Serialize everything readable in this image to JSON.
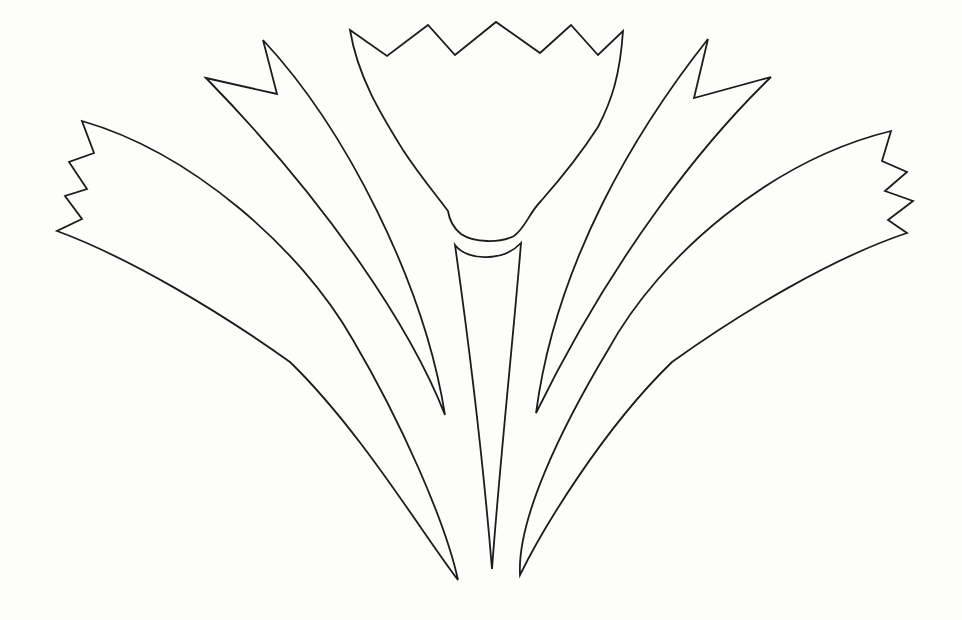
{
  "page": {
    "background": "#fdfdfc"
  },
  "drawing": {
    "canvas": {
      "width": 962,
      "height": 620,
      "stroke_color": "#1c1c1c",
      "stroke_width": 1.8,
      "fill": "none"
    },
    "shapes": [
      {
        "name": "outer-left-petal",
        "description": "curved petal blade with serrated zigzag outer end, sweeping from upper left down to bottom center",
        "path": "M 82 121 C 190 152 300 247 353 340 C 400 420 445 520 458 580 C 420 530 360 430 290 362 C 220 312 130 258 57 231 L 82 219 L 65 196 L 87 189 L 69 162 L 94 153 Z"
      },
      {
        "name": "inner-left-petal",
        "description": "slender curved blade with swallowtail notch at its upper tip, sweeping down to bottom center",
        "path": "M 206 78 L 277 94 L 263 40 C 345 128 424 282 445 415 C 412 330 330 205 206 78 Z"
      },
      {
        "name": "flower-corolla",
        "description": "central tulip-shaped bloom with five-point zigzag crown and rounded cup bottom",
        "path": "M 350 30 L 387 56 L 428 25 L 455 55 L 496 22 L 540 53 L 571 25 L 598 55 L 623 31 C 620 75 612 100 598 127 C 578 158 556 184 541 201 C 529 213 526 227 514 236 C 500 243 474 243 461 234 C 451 226 449 218 448 211 C 437 196 420 176 403 150 C 382 116 358 78 350 30 Z"
      },
      {
        "name": "flower-stem",
        "description": "narrow tapering stem with concave crescent top, pointed at the bottom",
        "path": "M 455 245 C 468 262 504 261 521 243 C 514 330 500 460 492 569 C 483 460 467 330 455 245 Z"
      },
      {
        "name": "inner-right-petal",
        "description": "slender curved blade with swallowtail notch at its upper tip, mirrored right side",
        "path": "M 708 39 L 694 98 L 771 77 C 706 140 616 250 536 413 C 556 262 636 130 708 39 Z"
      },
      {
        "name": "outer-right-petal",
        "description": "curved petal blade with serrated zigzag outer end, sweeping from upper right down to bottom center",
        "path": "M 891 131 C 772 160 660 255 608 350 C 560 430 517 520 520 575 C 542 530 602 430 672 362 C 742 312 832 258 907 233 L 888 220 L 913 201 L 885 191 L 907 172 L 882 161 Z"
      }
    ]
  }
}
